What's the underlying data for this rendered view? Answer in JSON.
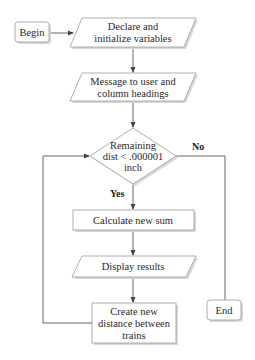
{
  "diagram": {
    "type": "flowchart",
    "nodes": {
      "begin": {
        "kind": "terminal",
        "lines": [
          "Begin"
        ]
      },
      "declare": {
        "kind": "io",
        "lines": [
          "Declare and",
          "initialize variables"
        ]
      },
      "message": {
        "kind": "io",
        "lines": [
          "Message to user and",
          "column headings"
        ]
      },
      "decision": {
        "kind": "decision",
        "lines": [
          "Remaining",
          "dist < .000001",
          "inch"
        ]
      },
      "calculate": {
        "kind": "process",
        "lines": [
          "Calculate new sum"
        ]
      },
      "display": {
        "kind": "io",
        "lines": [
          "Display results"
        ]
      },
      "create": {
        "kind": "process",
        "lines": [
          "Create new",
          "distance between",
          "trains"
        ]
      },
      "end": {
        "kind": "terminal",
        "lines": [
          "End"
        ]
      }
    },
    "edge_labels": {
      "yes": "Yes",
      "no": "No"
    },
    "edges": [
      {
        "from": "begin",
        "to": "declare"
      },
      {
        "from": "declare",
        "to": "message"
      },
      {
        "from": "message",
        "to": "decision"
      },
      {
        "from": "decision",
        "to": "calculate",
        "label": "Yes"
      },
      {
        "from": "calculate",
        "to": "display"
      },
      {
        "from": "display",
        "to": "create"
      },
      {
        "from": "create",
        "to": "decision"
      },
      {
        "from": "decision",
        "to": "end",
        "label": "No"
      }
    ]
  }
}
